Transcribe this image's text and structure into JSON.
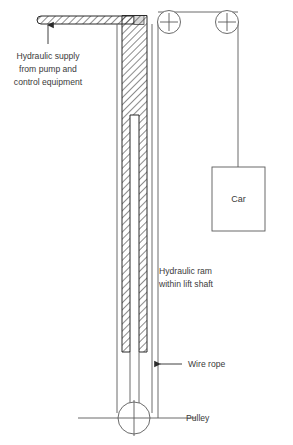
{
  "diagram": {
    "colors": {
      "line": "#5a5a5a",
      "hatch": "#2b2b2b",
      "text": "#3a3a3a",
      "background": "#ffffff"
    },
    "labels": {
      "supply_line1": "Hydraulic supply",
      "supply_line2": "from pump and",
      "supply_line3": "control equipment",
      "ram_line1": "Hydraulic ram",
      "ram_line2": "within lift shaft",
      "wire_rope": "Wire rope",
      "pulley": "Pulley",
      "car": "Car"
    },
    "components": [
      {
        "name": "hydraulic-supply-pipe",
        "kind": "hatched-bar"
      },
      {
        "name": "hydraulic-ram-cylinder",
        "kind": "hatched-column"
      },
      {
        "name": "top-left-pulley",
        "kind": "pulley"
      },
      {
        "name": "top-right-pulley",
        "kind": "pulley"
      },
      {
        "name": "bottom-pulley",
        "kind": "pulley"
      },
      {
        "name": "lift-car",
        "kind": "box"
      },
      {
        "name": "wire-rope",
        "kind": "line"
      }
    ]
  }
}
